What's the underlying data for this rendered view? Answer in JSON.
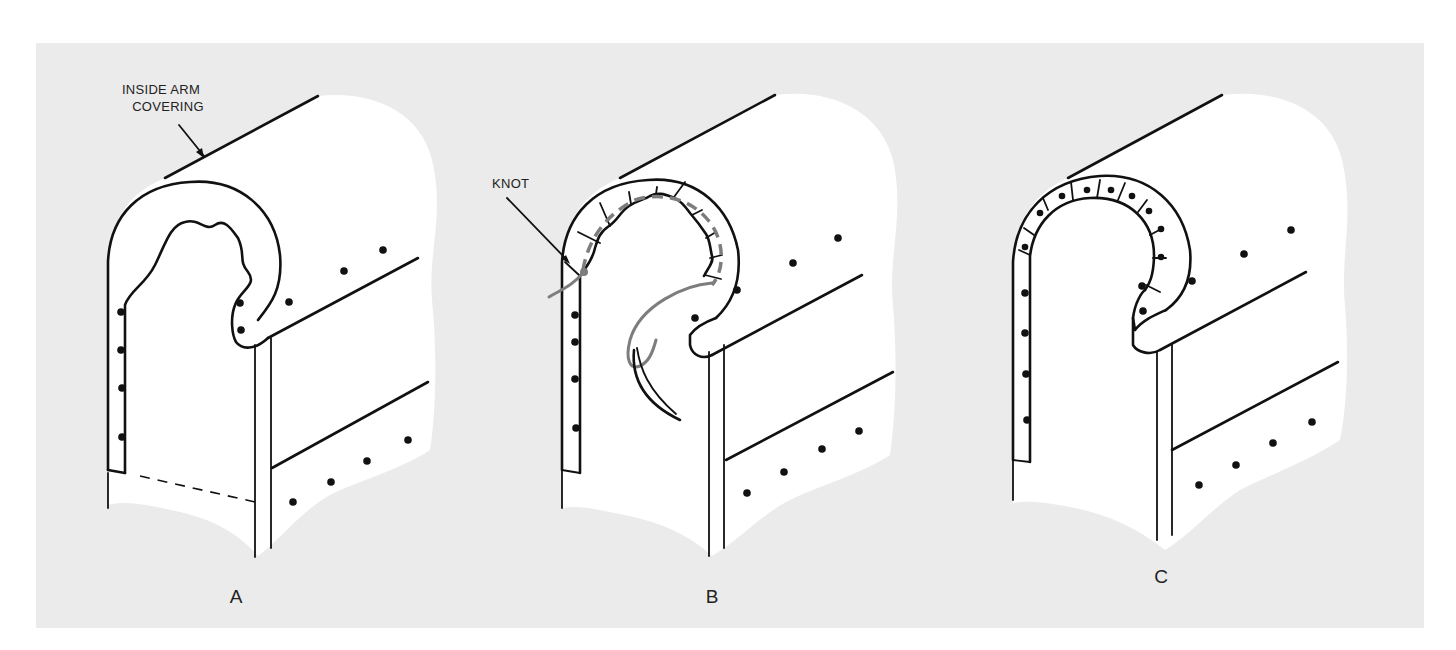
{
  "figure": {
    "background_color": "#ebebeb",
    "line_color": "#111111",
    "thread_color": "#7d7d7d",
    "panels": [
      {
        "id": "A",
        "letter": "A",
        "callout": {
          "line1": "INSIDE ARM",
          "line2": "COVERING"
        },
        "step": "Raw edge of covering wrapped around arm front"
      },
      {
        "id": "B",
        "letter": "B",
        "callout": {
          "line1": "KNOT"
        },
        "step": "Edge pleated and stitched with curved needle and thread"
      },
      {
        "id": "C",
        "letter": "C",
        "step": "Finished pleated edge tacked in place"
      }
    ]
  }
}
